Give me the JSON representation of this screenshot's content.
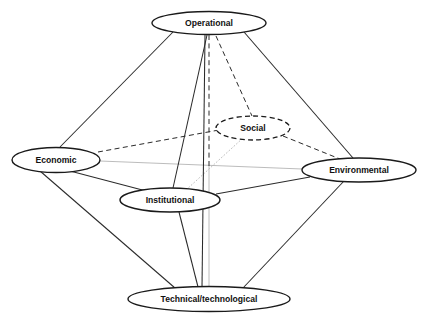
{
  "figure": {
    "type": "node-link-diagram",
    "shape": "octahedron",
    "background_color": "#ffffff",
    "clipped_top_caption": "",
    "width": 427,
    "height": 320
  },
  "nodes": [
    {
      "id": "operational",
      "label": "Operational",
      "cx": 209,
      "cy": 23,
      "rx": 57,
      "ry": 11.5,
      "style": "solid",
      "stroke_color": "#1a1a1a"
    },
    {
      "id": "economic",
      "label": "Economic",
      "cx": 56,
      "cy": 160,
      "rx": 44,
      "ry": 12.5,
      "style": "solid",
      "stroke_color": "#1a1a1a"
    },
    {
      "id": "environmental",
      "label": "Environmental",
      "cx": 359,
      "cy": 170,
      "rx": 57,
      "ry": 12,
      "style": "solid",
      "stroke_color": "#1a1a1a"
    },
    {
      "id": "social",
      "label": "Social",
      "cx": 253,
      "cy": 128,
      "rx": 37,
      "ry": 12,
      "style": "dashed",
      "stroke_color": "#2b2b2b"
    },
    {
      "id": "institutional",
      "label": "Institutional",
      "cx": 170,
      "cy": 200,
      "rx": 50,
      "ry": 12,
      "style": "solid",
      "stroke_color": "#1a1a1a"
    },
    {
      "id": "technical",
      "label": "Technical/technological",
      "cx": 209,
      "cy": 299,
      "rx": 81,
      "ry": 12.5,
      "style": "solid",
      "stroke_color": "#1a1a1a"
    }
  ],
  "edges": [
    {
      "id": "operational-economic",
      "from": "operational",
      "to": "economic",
      "style": "solid"
    },
    {
      "id": "operational-environmental",
      "from": "operational",
      "to": "environmental",
      "style": "solid"
    },
    {
      "id": "operational-institutional",
      "from": "operational",
      "to": "institutional",
      "style": "solid"
    },
    {
      "id": "operational-social",
      "from": "operational",
      "to": "social",
      "style": "dashed"
    },
    {
      "id": "operational-technical",
      "from": "operational",
      "to": "technical",
      "style": "solid"
    },
    {
      "id": "operational-center-axis",
      "from": "operational",
      "to": "center",
      "style": "dashed-axis"
    },
    {
      "id": "economic-social",
      "from": "economic",
      "to": "social",
      "style": "dashed"
    },
    {
      "id": "economic-institutional",
      "from": "economic",
      "to": "institutional",
      "style": "solid"
    },
    {
      "id": "economic-technical",
      "from": "economic",
      "to": "technical",
      "style": "solid"
    },
    {
      "id": "economic-environmental-axis",
      "from": "economic",
      "to": "environmental",
      "style": "gray-axis"
    },
    {
      "id": "social-environmental",
      "from": "social",
      "to": "environmental",
      "style": "dashed"
    },
    {
      "id": "social-institutional-axis",
      "from": "social",
      "to": "institutional",
      "style": "gray-dotted-axis"
    },
    {
      "id": "institutional-environmental",
      "from": "institutional",
      "to": "environmental",
      "style": "solid"
    },
    {
      "id": "institutional-technical",
      "from": "institutional",
      "to": "technical",
      "style": "solid"
    },
    {
      "id": "environmental-technical",
      "from": "environmental",
      "to": "technical",
      "style": "solid"
    },
    {
      "id": "center-technical-axis",
      "from": "center",
      "to": "technical",
      "style": "gray-axis"
    }
  ],
  "center_point": {
    "x": 209,
    "y": 166
  },
  "legend": {
    "solid_meaning": "visible edge",
    "dashed_meaning": "hidden edge",
    "axis_meaning": "central axis"
  }
}
